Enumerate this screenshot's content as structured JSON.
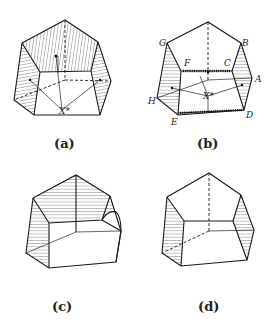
{
  "figure": {
    "panels": [
      {
        "id": "a",
        "caption": "(a)",
        "center_label": "X*"
      },
      {
        "id": "b",
        "caption": "(b)",
        "center_label": "X*",
        "vertex_labels": {
          "A": "A",
          "B": "B",
          "C": "C",
          "D": "D",
          "E": "E",
          "F": "F",
          "G": "G",
          "H": "H"
        }
      },
      {
        "id": "c",
        "caption": "(c)"
      },
      {
        "id": "d",
        "caption": "(d)"
      }
    ]
  }
}
